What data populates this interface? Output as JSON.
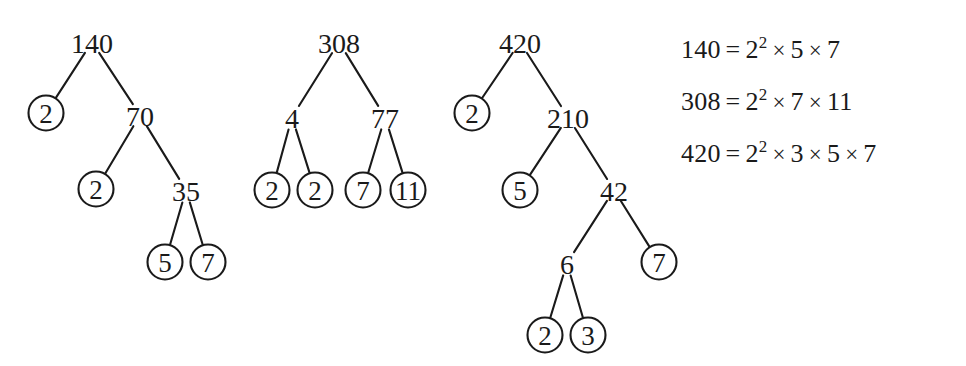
{
  "figure": {
    "ink_color": "#1a1a1a",
    "background_color": "#ffffff"
  },
  "trees": [
    {
      "name": "factor-tree-140",
      "root_value": "140",
      "nodes": [
        {
          "id": "t1-140",
          "label": "140",
          "circled": false,
          "x": 92,
          "y": 42
        },
        {
          "id": "t1-2a",
          "label": "2",
          "circled": true,
          "x": 46,
          "y": 113
        },
        {
          "id": "t1-70",
          "label": "70",
          "circled": false,
          "x": 140,
          "y": 115
        },
        {
          "id": "t1-2b",
          "label": "2",
          "circled": true,
          "x": 96,
          "y": 189
        },
        {
          "id": "t1-35",
          "label": "35",
          "circled": false,
          "x": 186,
          "y": 190
        },
        {
          "id": "t1-5",
          "label": "5",
          "circled": true,
          "x": 165,
          "y": 262
        },
        {
          "id": "t1-7",
          "label": "7",
          "circled": true,
          "x": 208,
          "y": 262
        }
      ],
      "edges": [
        {
          "from": "t1-140",
          "to": "t1-2a"
        },
        {
          "from": "t1-140",
          "to": "t1-70"
        },
        {
          "from": "t1-70",
          "to": "t1-2b"
        },
        {
          "from": "t1-70",
          "to": "t1-35"
        },
        {
          "from": "t1-35",
          "to": "t1-5"
        },
        {
          "from": "t1-35",
          "to": "t1-7"
        }
      ]
    },
    {
      "name": "factor-tree-308",
      "root_value": "308",
      "nodes": [
        {
          "id": "t2-308",
          "label": "308",
          "circled": false,
          "x": 339,
          "y": 42
        },
        {
          "id": "t2-4",
          "label": "4",
          "circled": false,
          "x": 292,
          "y": 117
        },
        {
          "id": "t2-77",
          "label": "77",
          "circled": false,
          "x": 385,
          "y": 117
        },
        {
          "id": "t2-2a",
          "label": "2",
          "circled": true,
          "x": 272,
          "y": 190
        },
        {
          "id": "t2-2b",
          "label": "2",
          "circled": true,
          "x": 315,
          "y": 190
        },
        {
          "id": "t2-7",
          "label": "7",
          "circled": true,
          "x": 363,
          "y": 190
        },
        {
          "id": "t2-11",
          "label": "11",
          "circled": true,
          "x": 408,
          "y": 190
        }
      ],
      "edges": [
        {
          "from": "t2-308",
          "to": "t2-4"
        },
        {
          "from": "t2-308",
          "to": "t2-77"
        },
        {
          "from": "t2-4",
          "to": "t2-2a"
        },
        {
          "from": "t2-4",
          "to": "t2-2b"
        },
        {
          "from": "t2-77",
          "to": "t2-7"
        },
        {
          "from": "t2-77",
          "to": "t2-11"
        }
      ]
    },
    {
      "name": "factor-tree-420",
      "root_value": "420",
      "nodes": [
        {
          "id": "t3-420",
          "label": "420",
          "circled": false,
          "x": 520,
          "y": 42
        },
        {
          "id": "t3-2a",
          "label": "2",
          "circled": true,
          "x": 472,
          "y": 113
        },
        {
          "id": "t3-210",
          "label": "210",
          "circled": false,
          "x": 568,
          "y": 117
        },
        {
          "id": "t3-5",
          "label": "5",
          "circled": true,
          "x": 520,
          "y": 190
        },
        {
          "id": "t3-42",
          "label": "42",
          "circled": false,
          "x": 614,
          "y": 190
        },
        {
          "id": "t3-6",
          "label": "6",
          "circled": false,
          "x": 567,
          "y": 263
        },
        {
          "id": "t3-7",
          "label": "7",
          "circled": true,
          "x": 659,
          "y": 262
        },
        {
          "id": "t3-2b",
          "label": "2",
          "circled": true,
          "x": 545,
          "y": 335
        },
        {
          "id": "t3-3",
          "label": "3",
          "circled": true,
          "x": 588,
          "y": 335
        }
      ],
      "edges": [
        {
          "from": "t3-420",
          "to": "t3-2a"
        },
        {
          "from": "t3-420",
          "to": "t3-210"
        },
        {
          "from": "t3-210",
          "to": "t3-5"
        },
        {
          "from": "t3-210",
          "to": "t3-42"
        },
        {
          "from": "t3-42",
          "to": "t3-6"
        },
        {
          "from": "t3-42",
          "to": "t3-7"
        },
        {
          "from": "t3-6",
          "to": "t3-2b"
        },
        {
          "from": "t3-6",
          "to": "t3-3"
        }
      ]
    }
  ],
  "equations": [
    {
      "name": "equation-140",
      "lhs": "140",
      "eq": "=",
      "terms": [
        {
          "base": "2",
          "exp": "2"
        },
        {
          "base": "5",
          "exp": ""
        },
        {
          "base": "7",
          "exp": ""
        }
      ],
      "operator": "×",
      "text": "140 = 2² × 5 × 7"
    },
    {
      "name": "equation-308",
      "lhs": "308",
      "eq": "=",
      "terms": [
        {
          "base": "2",
          "exp": "2"
        },
        {
          "base": "7",
          "exp": ""
        },
        {
          "base": "11",
          "exp": ""
        }
      ],
      "operator": "×",
      "text": "308 = 2² × 7 × 11"
    },
    {
      "name": "equation-420",
      "lhs": "420",
      "eq": "=",
      "terms": [
        {
          "base": "2",
          "exp": "2"
        },
        {
          "base": "3",
          "exp": ""
        },
        {
          "base": "5",
          "exp": ""
        },
        {
          "base": "7",
          "exp": ""
        }
      ],
      "operator": "×",
      "text": "420 = 2² × 3 × 5 × 7"
    }
  ]
}
